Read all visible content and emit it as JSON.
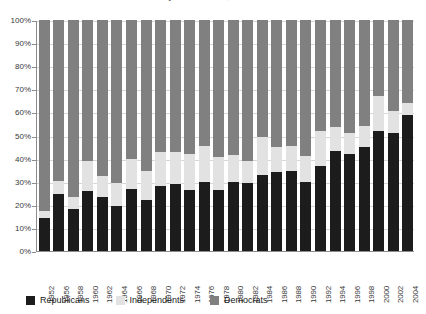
{
  "chart_data": {
    "type": "bar",
    "subtype": "stacked-percentage",
    "title": "Party Identification, 1952-2004",
    "xlabel": "",
    "ylabel": "",
    "ylim": [
      0,
      100
    ],
    "ytick_labels": [
      "0%",
      "10%",
      "20%",
      "30%",
      "40%",
      "50%",
      "60%",
      "70%",
      "80%",
      "90%",
      "100%"
    ],
    "ytick_values": [
      0,
      10,
      20,
      30,
      40,
      50,
      60,
      70,
      80,
      90,
      100
    ],
    "grid": true,
    "legend_position": "bottom-left",
    "categories": [
      "1952",
      "1956",
      "1958",
      "1960",
      "1962",
      "1964",
      "1966",
      "1968",
      "1970",
      "1972",
      "1974",
      "1976",
      "1978",
      "1980",
      "1982",
      "1984",
      "1986",
      "1988",
      "1990",
      "1992",
      "1994",
      "1996",
      "1998",
      "2000",
      "2002",
      "2004"
    ],
    "series": [
      {
        "name": "Republicans",
        "color": "#1c1c1c",
        "values": [
          14.5,
          24.5,
          18.0,
          26.0,
          23.5,
          19.5,
          27.0,
          22.0,
          28.0,
          29.0,
          26.5,
          30.0,
          26.5,
          30.0,
          29.5,
          33.0,
          34.0,
          34.5,
          30.0,
          37.0,
          43.5,
          42.0,
          45.0,
          52.0,
          51.0,
          59.0
        ]
      },
      {
        "name": "Independents",
        "color": "#e2e2e2",
        "values": [
          3.0,
          6.0,
          5.5,
          13.0,
          9.0,
          10.0,
          13.0,
          12.5,
          15.0,
          14.0,
          15.5,
          15.5,
          14.0,
          11.5,
          9.5,
          16.5,
          11.0,
          11.0,
          11.0,
          15.0,
          10.0,
          9.0,
          9.0,
          15.0,
          9.5,
          5.0
        ]
      },
      {
        "name": "Democrats",
        "color": "#808080",
        "values": [
          82.5,
          69.5,
          76.5,
          61.0,
          67.5,
          70.5,
          60.0,
          65.5,
          57.0,
          57.0,
          58.0,
          54.5,
          59.5,
          58.5,
          61.0,
          50.5,
          55.0,
          54.5,
          59.0,
          48.0,
          46.5,
          49.0,
          46.0,
          33.0,
          39.5,
          36.0
        ]
      }
    ]
  },
  "legend": {
    "items": [
      {
        "label": "Republicans",
        "color": "#1c1c1c"
      },
      {
        "label": "Independents",
        "color": "#e2e2e2"
      },
      {
        "label": "Democrats",
        "color": "#808080"
      }
    ]
  }
}
